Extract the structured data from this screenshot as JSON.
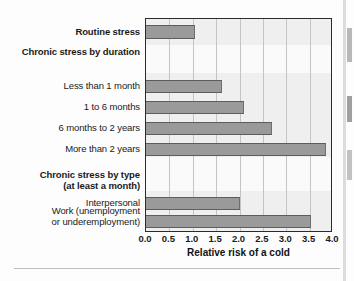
{
  "chart_data": {
    "type": "bar",
    "orientation": "horizontal",
    "title": "",
    "xlabel": "Relative risk of a cold",
    "ylabel": "",
    "xlim": [
      0.0,
      4.0
    ],
    "xticks": [
      "0.0",
      "0.5",
      "1.0",
      "1.5",
      "2.0",
      "2.5",
      "3.0",
      "3.5",
      "4.0"
    ],
    "xtick_values": [
      0.0,
      0.5,
      1.0,
      1.5,
      2.0,
      2.5,
      3.0,
      3.5,
      4.0
    ],
    "grid": true,
    "legend": null,
    "categories": [
      "Routine stress",
      "Chronic stress by duration",
      "Less than 1 month",
      "1 to 6 months",
      "6 months to 2 years",
      "More than 2 years",
      "Chronic stress by type\n(at least a month)",
      "Interpersonal",
      "Work (unemployment\nor underemployment)"
    ],
    "values": [
      1.05,
      null,
      1.62,
      2.1,
      2.7,
      3.85,
      null,
      2.02,
      3.52
    ],
    "rows": [
      {
        "label": "Routine stress",
        "value": 1.05,
        "is_header": true,
        "top": 6,
        "height": 14
      },
      {
        "label": "Chronic stress by duration",
        "value": null,
        "is_header": true,
        "top": 26,
        "height": 14
      },
      {
        "label": "Less than 1 month",
        "value": 1.62,
        "is_header": false,
        "top": 61,
        "height": 13
      },
      {
        "label": "1 to 6 months",
        "value": 2.1,
        "is_header": false,
        "top": 82,
        "height": 13
      },
      {
        "label": "6 months to 2 years",
        "value": 2.7,
        "is_header": false,
        "top": 103,
        "height": 13
      },
      {
        "label": "More than 2 years",
        "value": 3.85,
        "is_header": false,
        "top": 124,
        "height": 13
      },
      {
        "label": "Chronic stress by type\n(at least a month)",
        "value": null,
        "is_header": true,
        "top": 150,
        "height": 24
      },
      {
        "label": "Interpersonal",
        "value": 2.02,
        "is_header": false,
        "top": 178,
        "height": 13
      },
      {
        "label": "Work (unemployment\nor underemployment)",
        "value": 3.52,
        "is_header": false,
        "top": 196,
        "height": 13,
        "label_top": 191
      }
    ],
    "bands": [
      {
        "top": 0,
        "height": 26
      },
      {
        "top": 54,
        "height": 84
      },
      {
        "top": 172,
        "height": 42
      }
    ],
    "colors": {
      "bar_fill": "#9a9a9a",
      "bar_edge": "#5d5d5d",
      "plot_background": "#fafafa",
      "band_background": "#efefef",
      "gridline": "#c4c4c4",
      "frame": "#2b2b2b",
      "text": "#1a1a1a"
    }
  },
  "axis": {
    "title": "Relative risk of a cold"
  }
}
